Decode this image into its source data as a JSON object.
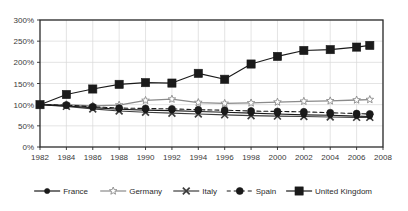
{
  "chart_data": {
    "type": "line",
    "title": "",
    "subtitle": "",
    "xlabel": "",
    "ylabel": "",
    "x": [
      1982,
      1984,
      1986,
      1988,
      1990,
      1992,
      1994,
      1996,
      1998,
      2000,
      2002,
      2004,
      2006,
      2007
    ],
    "xlim": [
      1982,
      2008
    ],
    "ylim": [
      0,
      300
    ],
    "xticks": [
      "1982",
      "1984",
      "1986",
      "1988",
      "1990",
      "1992",
      "1994",
      "1996",
      "1998",
      "2000",
      "2002",
      "2004",
      "2006",
      "2008"
    ],
    "xtick_values": [
      1982,
      1984,
      1986,
      1988,
      1990,
      1992,
      1994,
      1996,
      1998,
      2000,
      2002,
      2004,
      2006,
      2008
    ],
    "yticks": [
      "0%",
      "50%",
      "100%",
      "150%",
      "200%",
      "250%",
      "300%"
    ],
    "ytick_values": [
      0,
      50,
      100,
      150,
      200,
      250,
      300
    ],
    "grid": true,
    "legend_position": "bottom",
    "series": [
      {
        "name": "France",
        "color": "#1a1a1a",
        "marker": "dot-small",
        "dash": "solid",
        "values": [
          100,
          97,
          93,
          89,
          87,
          86,
          84,
          82,
          80,
          78,
          76,
          75,
          73,
          72
        ]
      },
      {
        "name": "Germany",
        "color": "#8a8a8a",
        "marker": "star-open",
        "dash": "solid",
        "values": [
          100,
          100,
          97,
          99,
          110,
          113,
          105,
          103,
          104,
          106,
          108,
          109,
          111,
          112
        ]
      },
      {
        "name": "Italy",
        "color": "#3d3d3d",
        "marker": "x",
        "dash": "solid",
        "values": [
          100,
          96,
          90,
          85,
          82,
          80,
          78,
          76,
          74,
          73,
          72,
          71,
          70,
          70
        ]
      },
      {
        "name": "Spain",
        "color": "#1a1a1a",
        "marker": "circle-filled",
        "dash": "dashed",
        "values": [
          100,
          99,
          95,
          92,
          91,
          90,
          88,
          87,
          85,
          84,
          83,
          81,
          79,
          78
        ]
      },
      {
        "name": "United Kingdom",
        "color": "#1a1a1a",
        "marker": "square-filled",
        "dash": "solid",
        "values": [
          100,
          124,
          137,
          148,
          152,
          151,
          174,
          160,
          196,
          214,
          228,
          230,
          236,
          240
        ]
      }
    ]
  },
  "legend": {
    "items": [
      {
        "label": "France"
      },
      {
        "label": "Germany"
      },
      {
        "label": "Italy"
      },
      {
        "label": "Spain"
      },
      {
        "label": "United Kingdom"
      }
    ]
  }
}
